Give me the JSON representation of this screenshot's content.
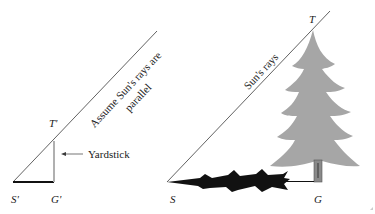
{
  "diagram": {
    "title": "",
    "left": {
      "ray_label_line1": "Assume Sun's rays are",
      "ray_label_line2": "parallel",
      "top_label": "T'",
      "shadow_start_label": "S'",
      "ground_label": "G'",
      "object_label": "Yardstick"
    },
    "right": {
      "ray_label": "Sun's rays",
      "top_label": "T",
      "shadow_start_label": "S",
      "ground_label": "G"
    },
    "colors": {
      "line": "#3a3a3a",
      "tree": "#a6a6a6",
      "shadow": "#111111",
      "yardstick": "#b0b0b0"
    }
  }
}
